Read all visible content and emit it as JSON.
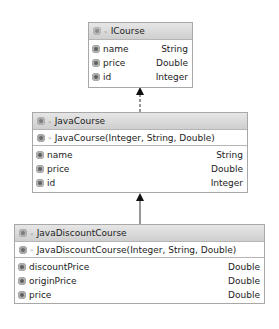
{
  "classes": {
    "icourse": {
      "name": "ICourse",
      "kind": "interface",
      "fields": [
        {
          "name": "name",
          "type": "String"
        },
        {
          "name": "price",
          "type": "Double"
        },
        {
          "name": "id",
          "type": "Integer"
        }
      ]
    },
    "javacourse": {
      "name": "JavaCourse",
      "kind": "class",
      "constructor": "JavaCourse(Integer, String, Double)",
      "fields": [
        {
          "name": "name",
          "type": "String"
        },
        {
          "name": "price",
          "type": "Double"
        },
        {
          "name": "id",
          "type": "Integer"
        }
      ]
    },
    "javadiscountcourse": {
      "name": "JavaDiscountCourse",
      "kind": "class",
      "constructor": "JavaDiscountCourse(Integer, String, Double)",
      "fields": [
        {
          "name": "discountPrice",
          "type": "Double"
        },
        {
          "name": "originPrice",
          "type": "Double"
        },
        {
          "name": "price",
          "type": "Double"
        }
      ]
    }
  },
  "relations": [
    {
      "from": "JavaCourse",
      "to": "ICourse",
      "type": "implements",
      "style": "dashed"
    },
    {
      "from": "JavaDiscountCourse",
      "to": "JavaCourse",
      "type": "extends",
      "style": "solid"
    }
  ]
}
